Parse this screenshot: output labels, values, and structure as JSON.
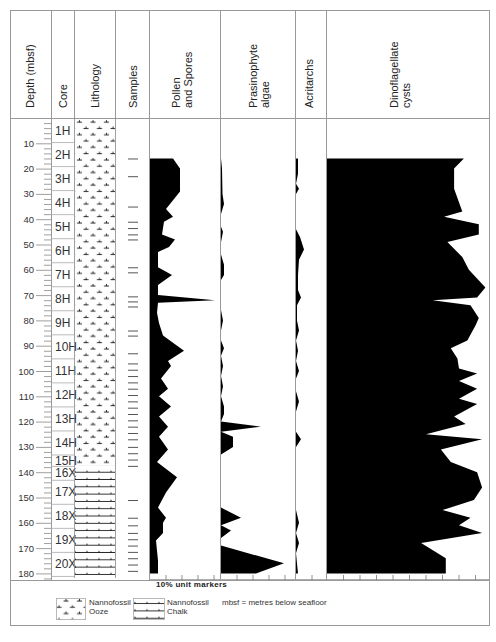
{
  "chart_data": {
    "type": "area",
    "ylabel": "Depth (mbsf)",
    "ylim": [
      0,
      180
    ],
    "depth_ticks": [
      10,
      20,
      30,
      40,
      50,
      60,
      70,
      80,
      90,
      100,
      110,
      120,
      130,
      140,
      150,
      160,
      170,
      180
    ],
    "columns": [
      "Depth (mbsf)",
      "Core",
      "Lithology",
      "Samples",
      "Pollen and Spores",
      "Prasinophyte algae",
      "Acritarchs",
      "Dinoflagellate cysts"
    ],
    "x_scale_note": "10% unit markers",
    "cores": [
      {
        "label": "1H",
        "top": 0,
        "bottom": 9.5
      },
      {
        "label": "2H",
        "top": 9.5,
        "bottom": 19
      },
      {
        "label": "3H",
        "top": 19,
        "bottom": 28.5
      },
      {
        "label": "4H",
        "top": 28.5,
        "bottom": 38
      },
      {
        "label": "5H",
        "top": 38,
        "bottom": 47.5
      },
      {
        "label": "6H",
        "top": 47.5,
        "bottom": 57
      },
      {
        "label": "7H",
        "top": 57,
        "bottom": 66.5
      },
      {
        "label": "8H",
        "top": 66.5,
        "bottom": 76
      },
      {
        "label": "9H",
        "top": 76,
        "bottom": 85.5
      },
      {
        "label": "10H",
        "top": 85.5,
        "bottom": 95
      },
      {
        "label": "11H",
        "top": 95,
        "bottom": 104.5
      },
      {
        "label": "12H",
        "top": 104.5,
        "bottom": 114
      },
      {
        "label": "13H",
        "top": 114,
        "bottom": 123.5
      },
      {
        "label": "14H",
        "top": 123.5,
        "bottom": 133
      },
      {
        "label": "15H",
        "top": 133,
        "bottom": 137.5
      },
      {
        "label": "16X",
        "top": 137.5,
        "bottom": 143
      },
      {
        "label": "17X",
        "top": 143,
        "bottom": 152.5
      },
      {
        "label": "18X",
        "top": 152.5,
        "bottom": 162
      },
      {
        "label": "19X",
        "top": 162,
        "bottom": 171.5
      },
      {
        "label": "20X",
        "top": 171.5,
        "bottom": 181
      }
    ],
    "lithology": [
      {
        "name": "Nannofossil Ooze",
        "top": 0,
        "bottom": 137.5
      },
      {
        "name": "Nannofossil Chalk",
        "top": 137.5,
        "bottom": 181
      }
    ],
    "samples_depths": [
      16,
      23,
      35,
      41,
      43.5,
      46,
      48,
      59,
      61,
      70.5,
      72.5,
      74.5,
      84,
      86,
      93,
      97,
      99.5,
      102,
      104.5,
      107,
      109.5,
      112,
      114.5,
      117,
      119.5,
      122,
      124.5,
      127,
      130,
      132.5,
      135,
      137.5,
      151,
      158,
      161,
      164,
      166.5,
      169,
      171.5,
      174,
      176.5,
      179
    ],
    "series": [
      {
        "name": "Pollen and Spores",
        "unit": "%",
        "points": [
          [
            16,
            15
          ],
          [
            16,
            23
          ],
          [
            20,
            30
          ],
          [
            29,
            30
          ],
          [
            36,
            16
          ],
          [
            39,
            23
          ],
          [
            41,
            14
          ],
          [
            46,
            12
          ],
          [
            48,
            25
          ],
          [
            51,
            19
          ],
          [
            53,
            8
          ],
          [
            59,
            8
          ],
          [
            62,
            22
          ],
          [
            66,
            8
          ],
          [
            70,
            8
          ],
          [
            72,
            65
          ],
          [
            73,
            8
          ],
          [
            77,
            7
          ],
          [
            81,
            9
          ],
          [
            86,
            13
          ],
          [
            92,
            34
          ],
          [
            96,
            18
          ],
          [
            98,
            21
          ],
          [
            103,
            11
          ],
          [
            107,
            18
          ],
          [
            110,
            9
          ],
          [
            114,
            21
          ],
          [
            118,
            9
          ],
          [
            122,
            18
          ],
          [
            126,
            9
          ],
          [
            131,
            18
          ],
          [
            136,
            7
          ],
          [
            142,
            27
          ],
          [
            148,
            16
          ],
          [
            154,
            8
          ],
          [
            158,
            16
          ],
          [
            160,
            13
          ],
          [
            164,
            13
          ],
          [
            167,
            6
          ],
          [
            175,
            8
          ],
          [
            180,
            8
          ]
        ]
      },
      {
        "name": "Prasinophyte algae",
        "unit": "%",
        "points": [
          [
            16,
            0
          ],
          [
            20,
            1
          ],
          [
            30,
            1.5
          ],
          [
            34,
            3
          ],
          [
            38,
            0
          ],
          [
            43,
            0
          ],
          [
            45,
            2
          ],
          [
            49,
            0
          ],
          [
            54,
            0
          ],
          [
            58,
            3
          ],
          [
            62,
            3
          ],
          [
            64,
            0
          ],
          [
            72,
            0
          ],
          [
            76,
            0
          ],
          [
            80,
            2
          ],
          [
            84,
            0
          ],
          [
            88,
            0
          ],
          [
            91,
            3
          ],
          [
            94,
            0
          ],
          [
            98,
            2
          ],
          [
            102,
            0
          ],
          [
            106,
            2
          ],
          [
            110,
            0
          ],
          [
            114,
            3
          ],
          [
            117,
            3
          ],
          [
            120,
            0
          ],
          [
            122,
            40
          ],
          [
            124,
            0
          ],
          [
            126,
            12
          ],
          [
            130,
            12
          ],
          [
            133,
            0
          ],
          [
            140,
            0
          ],
          [
            148,
            0
          ],
          [
            154,
            0
          ],
          [
            158,
            20
          ],
          [
            161,
            0
          ],
          [
            163,
            10
          ],
          [
            166,
            0
          ],
          [
            169,
            0
          ],
          [
            176,
            63
          ],
          [
            180,
            35
          ]
        ]
      },
      {
        "name": "Acritarchs",
        "unit": "%",
        "points": [
          [
            16,
            2
          ],
          [
            22,
            2
          ],
          [
            26,
            0
          ],
          [
            28,
            3
          ],
          [
            30,
            0
          ],
          [
            44,
            0
          ],
          [
            47,
            4
          ],
          [
            52,
            8
          ],
          [
            56,
            3
          ],
          [
            62,
            2
          ],
          [
            68,
            2
          ],
          [
            71,
            5
          ],
          [
            74,
            1
          ],
          [
            80,
            1
          ],
          [
            84,
            3
          ],
          [
            88,
            0
          ],
          [
            92,
            2
          ],
          [
            96,
            0
          ],
          [
            100,
            3
          ],
          [
            103,
            0
          ],
          [
            108,
            0
          ],
          [
            112,
            3
          ],
          [
            116,
            0
          ],
          [
            124,
            0
          ],
          [
            127,
            5
          ],
          [
            130,
            0
          ],
          [
            140,
            0
          ],
          [
            148,
            0
          ],
          [
            155,
            0
          ],
          [
            160,
            3
          ],
          [
            164,
            0
          ],
          [
            168,
            3
          ],
          [
            172,
            0
          ],
          [
            180,
            2
          ]
        ]
      },
      {
        "name": "Dinoflagellate cysts",
        "unit": "%",
        "points": [
          [
            16,
            83
          ],
          [
            20,
            77
          ],
          [
            28,
            77
          ],
          [
            37,
            82
          ],
          [
            39,
            71
          ],
          [
            42,
            92
          ],
          [
            46,
            92
          ],
          [
            49,
            73
          ],
          [
            55,
            82
          ],
          [
            60,
            86
          ],
          [
            67,
            96
          ],
          [
            71,
            91
          ],
          [
            72,
            64
          ],
          [
            74,
            87
          ],
          [
            79,
            92
          ],
          [
            82,
            90
          ],
          [
            88,
            85
          ],
          [
            91,
            75
          ],
          [
            95,
            79
          ],
          [
            99,
            80
          ],
          [
            101,
            91
          ],
          [
            104,
            80
          ],
          [
            107,
            91
          ],
          [
            111,
            80
          ],
          [
            113,
            91
          ],
          [
            118,
            77
          ],
          [
            121,
            84
          ],
          [
            125,
            60
          ],
          [
            127,
            94
          ],
          [
            131,
            69
          ],
          [
            136,
            75
          ],
          [
            140,
            91
          ],
          [
            146,
            94
          ],
          [
            151,
            89
          ],
          [
            155,
            70
          ],
          [
            158,
            87
          ],
          [
            161,
            80
          ],
          [
            164,
            94
          ],
          [
            168,
            57
          ],
          [
            174,
            72
          ],
          [
            180,
            72
          ]
        ]
      }
    ],
    "legend": [
      {
        "name": "Nannofossil Ooze",
        "pattern": "ooze"
      },
      {
        "name": "Nannofossil Chalk",
        "pattern": "chalk"
      }
    ],
    "annotation": "mbsf = metres below seafloor"
  },
  "headers": {
    "depth": "Depth (mbsf)",
    "core": "Core",
    "lithology": "Lithology",
    "samples": "Samples",
    "pollen_line1": "Pollen",
    "pollen_line2": "and Spores",
    "prasino_line1": "Prasinophyte",
    "prasino_line2": "algae",
    "acritarchs": "Acritarchs",
    "dino_line1": "Dinoflagellate",
    "dino_line2": "cysts"
  },
  "scale_label": "10% unit markers",
  "legend": {
    "ooze_line1": "Nannofossil",
    "ooze_line2": "Ooze",
    "chalk_line1": "Nannofossil",
    "chalk_line2": "Chalk",
    "abbrev": "mbsf = metres below seafloor"
  },
  "colors": {
    "fill": "#000000",
    "grid": "#999999",
    "frame": "#888888"
  }
}
